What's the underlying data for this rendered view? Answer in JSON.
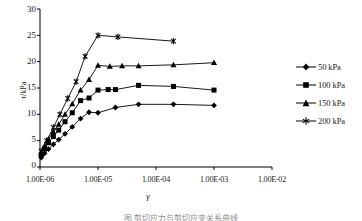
{
  "chart_data": {
    "type": "line",
    "title": "",
    "subtitle": "",
    "xlabel": "γ",
    "ylabel": "τ/kPa",
    "x_scale": "log",
    "y_scale": "linear",
    "xlim": [
      1e-06,
      0.01
    ],
    "ylim": [
      0,
      30
    ],
    "grid": false,
    "legend_position": "right",
    "x_tick_labels": [
      "1.00E-06",
      "1.00E-05",
      "1.00E-04",
      "1.00E-03",
      "1.00E-02"
    ],
    "x_tick_values": [
      1e-06,
      1e-05,
      0.0001,
      0.001,
      0.01
    ],
    "y_tick_labels": [
      "0",
      "5",
      "10",
      "15",
      "20",
      "25",
      "30"
    ],
    "y_tick_values": [
      0,
      5,
      10,
      15,
      20,
      25,
      30
    ],
    "series": [
      {
        "name": "50 kPa",
        "marker": "diamond",
        "color": "#000000",
        "x": [
          1.05e-06,
          1.2e-06,
          1.4e-06,
          1.7e-06,
          2.1e-06,
          2.7e-06,
          3.6e-06,
          5e-06,
          7e-06,
          1e-05,
          2e-05,
          5e-05,
          0.0002,
          0.001
        ],
        "y": [
          1.8,
          2.6,
          3.4,
          4.3,
          5.2,
          6.3,
          7.6,
          9.2,
          10.4,
          10.3,
          11.3,
          11.9,
          11.9,
          11.7
        ]
      },
      {
        "name": "100 kPa",
        "marker": "square",
        "color": "#000000",
        "x": [
          1.05e-06,
          1.2e-06,
          1.4e-06,
          1.7e-06,
          2.1e-06,
          2.7e-06,
          3.6e-06,
          5e-06,
          7e-06,
          1e-05,
          1.5e-05,
          2e-05,
          5e-05,
          0.0002,
          0.001
        ],
        "y": [
          2.3,
          3.5,
          4.6,
          5.8,
          7.0,
          8.6,
          10.3,
          12.6,
          13.1,
          14.6,
          14.7,
          14.7,
          15.5,
          15.3,
          14.6
        ]
      },
      {
        "name": "150 kPa",
        "marker": "triangle",
        "color": "#000000",
        "x": [
          1.05e-06,
          1.2e-06,
          1.4e-06,
          1.7e-06,
          2.1e-06,
          2.7e-06,
          3.6e-06,
          5e-06,
          7e-06,
          1e-05,
          1.6e-05,
          2.6e-05,
          5e-05,
          0.0002,
          0.001
        ],
        "y": [
          2.6,
          4.0,
          5.3,
          6.7,
          8.1,
          10.0,
          12.0,
          14.6,
          16.6,
          19.3,
          19.1,
          19.2,
          19.2,
          19.4,
          19.8
        ]
      },
      {
        "name": "200 kPa",
        "marker": "asterisk",
        "color": "#000000",
        "x": [
          1.05e-06,
          1.3e-06,
          1.7e-06,
          2.2e-06,
          3e-06,
          4.2e-06,
          6e-06,
          1e-05,
          2.2e-05,
          0.0002
        ],
        "y": [
          3.0,
          5.0,
          7.5,
          10.0,
          13.0,
          16.2,
          21.0,
          25.0,
          24.7,
          23.9
        ]
      }
    ]
  },
  "legend": {
    "entries": [
      {
        "label": "50 kPa"
      },
      {
        "label": "100 kPa"
      },
      {
        "label": "150 kPa"
      },
      {
        "label": "200 kPa"
      }
    ]
  },
  "caption": {
    "text": "图  剪切应力与剪切应变关系曲线"
  }
}
